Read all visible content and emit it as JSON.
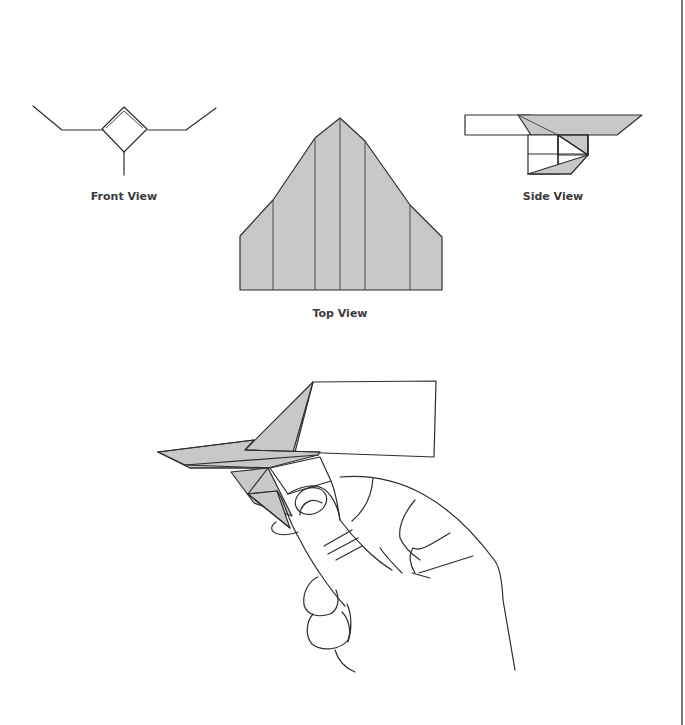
{
  "diagram": {
    "type": "origami-paper-airplane-instructions",
    "labels": {
      "front_view": "Front View",
      "top_view": "Top View",
      "side_view": "Side View"
    },
    "colors": {
      "paper_fill": "#c8c8c8",
      "line": "#2e2e2e",
      "label_text": "#3a3a3a",
      "margin_rule": "#7a7a7a",
      "background": "#ffffff"
    },
    "views": [
      {
        "id": "front",
        "label_key": "front_view"
      },
      {
        "id": "top",
        "label_key": "top_view"
      },
      {
        "id": "side",
        "label_key": "side_view"
      },
      {
        "id": "hand",
        "description": "hand holding folded plane underneath"
      }
    ]
  }
}
